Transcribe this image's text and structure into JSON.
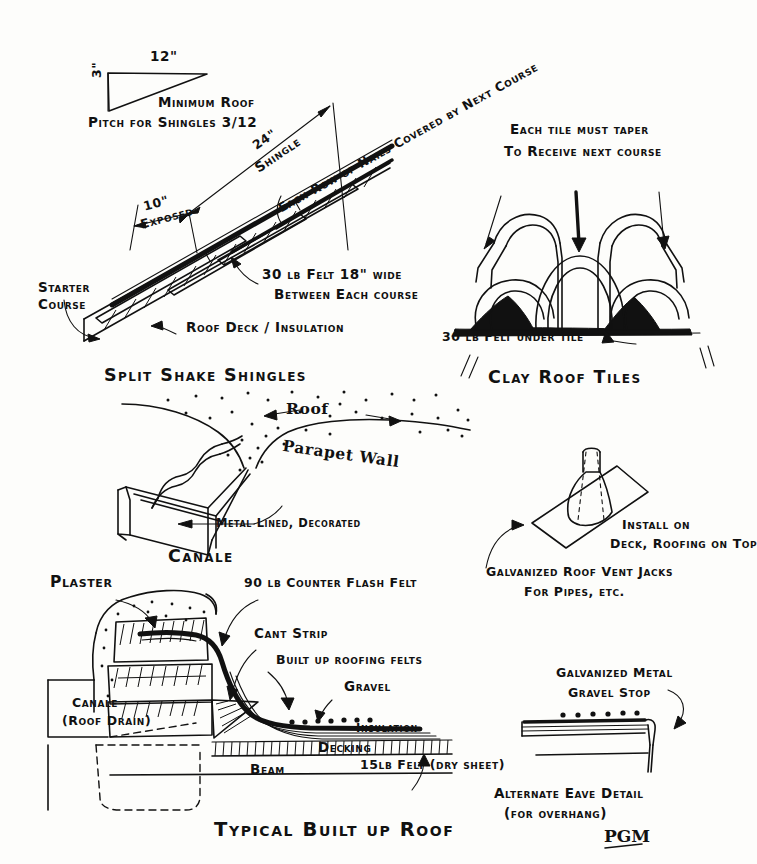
{
  "sheet": {
    "title": "Roofing Details — hand-drawn architectural sheet",
    "signature": "PGM"
  },
  "pitch_diagram": {
    "run_label": "12\"",
    "rise_label": "3\"",
    "caption_line1": "Minimum Roof",
    "caption_line2": "Pitch for Shingles 3/12"
  },
  "shingle_diagram": {
    "section_title": "Split Shake Shingles",
    "dim_shingle": "24\"",
    "dim_shingle_name": "Shingle",
    "dim_exposed": "10\"",
    "dim_exposed_name": "Exposed",
    "note_nails": "Each Row of Nails Covered by Next Course",
    "note_felt_line1": "30 lb Felt 18\" wide",
    "note_felt_line2": "Between Each course",
    "note_deck": "Roof Deck / Insulation",
    "note_starter_line1": "Starter",
    "note_starter_line2": "Course"
  },
  "clay_tiles": {
    "section_title": "Clay Roof Tiles",
    "note_taper_line1": "Each tile must taper",
    "note_taper_line2": "To Receive next course",
    "note_felt": "30 lb Felt under tile"
  },
  "canale": {
    "section_title": "Canale",
    "label_roof": "Roof",
    "label_parapet": "Parapet Wall",
    "label_metal": "Metal Lined, Decorated"
  },
  "vent_jack": {
    "note_install_line1": "Install on",
    "note_install_line2": "Deck, Roofing on Top",
    "caption_line1": "Galvanized Roof Vent Jacks",
    "caption_line2": "For Pipes, etc."
  },
  "built_up_roof": {
    "section_title": "Typical Built up Roof",
    "label_plaster": "Plaster",
    "label_counterflash": "90 lb Counter Flash Felt",
    "label_cant": "Cant Strip",
    "label_builtup": "Built up roofing felts",
    "label_gravel": "Gravel",
    "label_insulation": "Insulation",
    "label_decking": "Decking",
    "label_beam": "Beam",
    "label_dry_sheet": "15lb Felt (dry sheet)",
    "label_canale_line1": "Canale",
    "label_canale_line2": "(Roof Drain)"
  },
  "eave_detail": {
    "label_gravel_stop_line1": "Galvanized Metal",
    "label_gravel_stop_line2": "Gravel Stop",
    "caption_line1": "Alternate Eave Detail",
    "caption_line2": "(for overhang)"
  },
  "colors": {
    "ink": "#111111",
    "paper": "#fdfdfb"
  }
}
